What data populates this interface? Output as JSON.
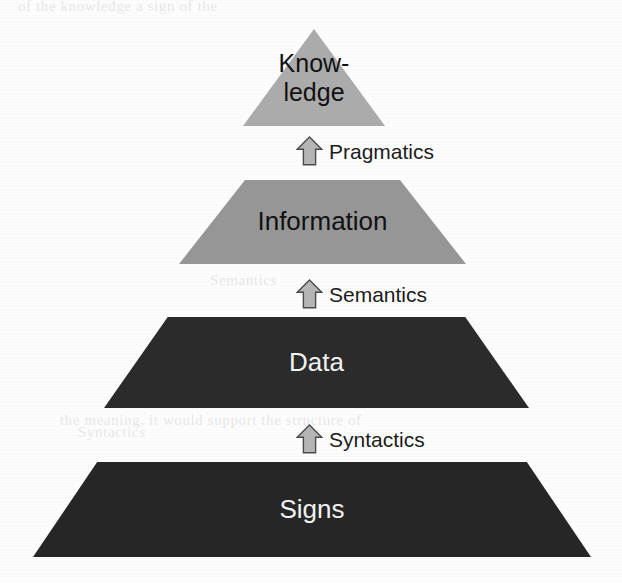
{
  "figure": {
    "name": "Knowledge Pyramid",
    "background_color": "#fdfdfd",
    "ghost_artifacts": [
      "of the knowledge a sign of the",
      "the meaning, it would support the structure of",
      "Syntactics",
      "Semantics"
    ]
  },
  "levels": [
    {
      "id": "knowledge",
      "label": "Know-\nledge",
      "shape": "triangle",
      "fill": "#ababab",
      "text_color": "#111111",
      "font_size": 25,
      "geometry": {
        "left": 243,
        "top": 29,
        "width": 142,
        "height": 97,
        "top_inset_pct": 50
      }
    },
    {
      "id": "information",
      "label": "Information",
      "shape": "trapezoid",
      "fill": "#969696",
      "text_color": "#111111",
      "font_size": 26,
      "geometry": {
        "left": 179,
        "top": 180,
        "width": 287,
        "height": 84,
        "top_inset_pct": 23
      }
    },
    {
      "id": "data",
      "label": "Data",
      "shape": "trapezoid",
      "fill": "#2b2b2b",
      "text_color": "#f2f2f2",
      "font_size": 26,
      "geometry": {
        "left": 104,
        "top": 317,
        "width": 425,
        "height": 91,
        "top_inset_pct": 15
      }
    },
    {
      "id": "signs",
      "label": "Signs",
      "shape": "trapezoid",
      "fill": "#262626",
      "text_color": "#f2f2f2",
      "font_size": 26,
      "geometry": {
        "left": 33,
        "top": 462,
        "width": 558,
        "height": 95,
        "top_inset_pct": 11.5
      }
    }
  ],
  "connectors": [
    {
      "id": "pragmatics",
      "label": "Pragmatics",
      "icon": "up-arrow-icon",
      "arrow_fill": "#b5b5b5",
      "arrow_stroke": "#4a4a4a",
      "geometry": {
        "left": 296,
        "top": 136,
        "arrow_w": 27,
        "arrow_h": 30
      }
    },
    {
      "id": "semantics",
      "label": "Semantics",
      "icon": "up-arrow-icon",
      "arrow_fill": "#b5b5b5",
      "arrow_stroke": "#4a4a4a",
      "geometry": {
        "left": 296,
        "top": 279,
        "arrow_w": 27,
        "arrow_h": 30
      }
    },
    {
      "id": "syntactics",
      "label": "Syntactics",
      "icon": "up-arrow-icon",
      "arrow_fill": "#b5b5b5",
      "arrow_stroke": "#4a4a4a",
      "geometry": {
        "left": 296,
        "top": 424,
        "arrow_w": 27,
        "arrow_h": 30
      }
    }
  ],
  "chart_data": {
    "type": "pyramid",
    "levels_bottom_to_top": [
      "Signs",
      "Data",
      "Information",
      "Knowledge"
    ],
    "transitions_bottom_to_top": [
      "Syntactics",
      "Semantics",
      "Pragmatics"
    ],
    "level_fills": [
      "#262626",
      "#2b2b2b",
      "#969696",
      "#ababab"
    ],
    "relative_widths": [
      1.0,
      0.762,
      0.514,
      0.254
    ],
    "legend": "none",
    "grid": false
  }
}
